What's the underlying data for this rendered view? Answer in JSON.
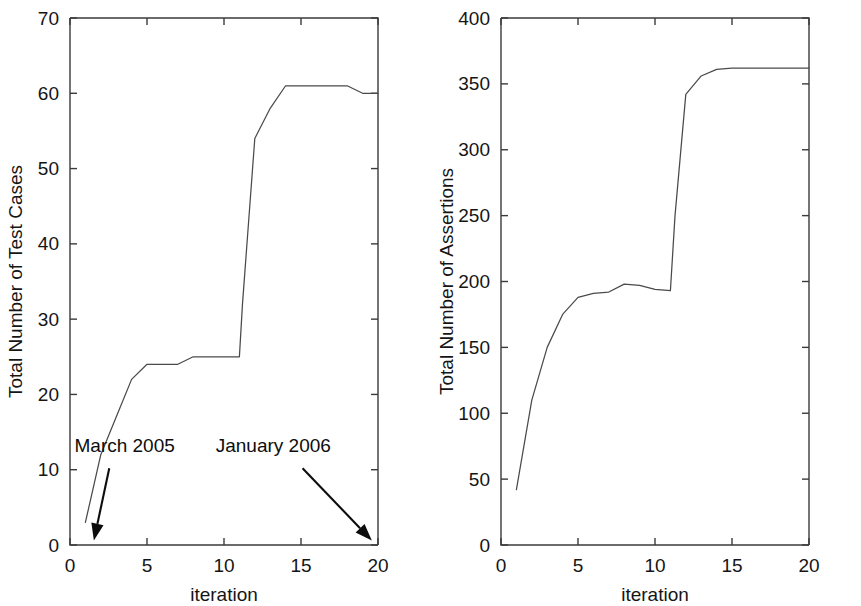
{
  "figure": {
    "background_color": "#ffffff",
    "line_color": "#4a4a4a",
    "axis_color": "#3b3b3b",
    "text_color": "#151515"
  },
  "chart_data": [
    {
      "type": "line",
      "title": "",
      "xlabel": "iteration",
      "ylabel": "Total Number of Test Cases",
      "xlim": [
        0,
        20
      ],
      "ylim": [
        0,
        70
      ],
      "xticks": [
        0,
        5,
        10,
        15,
        20
      ],
      "yticks": [
        0,
        10,
        20,
        30,
        40,
        50,
        60,
        70
      ],
      "xticklabels": [
        "0",
        "5",
        "10",
        "15",
        "20"
      ],
      "yticklabels": [
        "0",
        "10",
        "20",
        "30",
        "40",
        "50",
        "60",
        "70"
      ],
      "grid": false,
      "legend": "none",
      "x": [
        1,
        2,
        3,
        4,
        5,
        6,
        7,
        8,
        9,
        10,
        11,
        11.2,
        12,
        13,
        14,
        15,
        16,
        17,
        18,
        19,
        20
      ],
      "values": [
        3,
        12,
        17,
        22,
        24,
        24,
        24,
        25,
        25,
        25,
        25,
        32,
        54,
        58,
        61,
        61,
        61,
        61,
        61,
        60,
        60
      ],
      "annotations": [
        {
          "label": "March 2005",
          "text_x": 3.55,
          "text_y": 12.4,
          "arrow_from_x": 2.55,
          "arrow_from_y": 10.2,
          "arrow_to_x": 1.55,
          "arrow_to_y": 0.6
        },
        {
          "label": "January 2006",
          "text_x": 13.2,
          "text_y": 12.4,
          "arrow_from_x": 15.1,
          "arrow_from_y": 10.2,
          "arrow_to_x": 19.6,
          "arrow_to_y": 0.6
        }
      ]
    },
    {
      "type": "line",
      "title": "",
      "xlabel": "iteration",
      "ylabel": "Total Number of Assertions",
      "xlim": [
        0,
        20
      ],
      "ylim": [
        0,
        400
      ],
      "xticks": [
        0,
        5,
        10,
        15,
        20
      ],
      "yticks": [
        0,
        50,
        100,
        150,
        200,
        250,
        300,
        350,
        400
      ],
      "xticklabels": [
        "0",
        "5",
        "10",
        "15",
        "20"
      ],
      "yticklabels": [
        "0",
        "50",
        "100",
        "150",
        "200",
        "250",
        "300",
        "350",
        "400"
      ],
      "grid": false,
      "legend": "none",
      "x": [
        1,
        2,
        3,
        4,
        5,
        6,
        7,
        8,
        9,
        10,
        11,
        11.3,
        12,
        13,
        14,
        15,
        16,
        17,
        18,
        19,
        20
      ],
      "values": [
        42,
        110,
        150,
        175,
        188,
        191,
        192,
        198,
        197,
        194,
        193,
        250,
        342,
        356,
        361,
        362,
        362,
        362,
        362,
        362,
        362
      ],
      "annotations": []
    }
  ]
}
